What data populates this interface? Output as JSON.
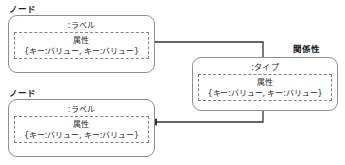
{
  "diagram": {
    "title": "",
    "colors": {
      "box_border": "#8a8f94",
      "inner_dashed_border": "#7f858a",
      "connector": "#333333",
      "text": "#2a2a2a",
      "background": "#ffffff"
    },
    "nodes": [
      {
        "id": "node-top",
        "caption": "ノード",
        "heading": ":ラベル",
        "properties_title": "属性",
        "properties_value": "{キー:バリュー, キー:バリュー}"
      },
      {
        "id": "node-bottom",
        "caption": "ノード",
        "heading": ":ラベル",
        "properties_title": "属性",
        "properties_value": "{キー:バリュー, キー:バリュー}"
      }
    ],
    "relationship": {
      "id": "relationship-box",
      "caption": "関係性",
      "heading": ":タイプ",
      "properties_title": "属性",
      "properties_value": "{キー:バリュー, キー:バリュー}"
    },
    "connectors": [
      {
        "id": "connector-node-top-to-relationship",
        "from": "node-top",
        "to": "relationship-box",
        "arrowhead": "none"
      },
      {
        "id": "connector-relationship-to-node-bottom",
        "from": "relationship-box",
        "to": "node-bottom",
        "arrowhead": "left"
      }
    ]
  }
}
